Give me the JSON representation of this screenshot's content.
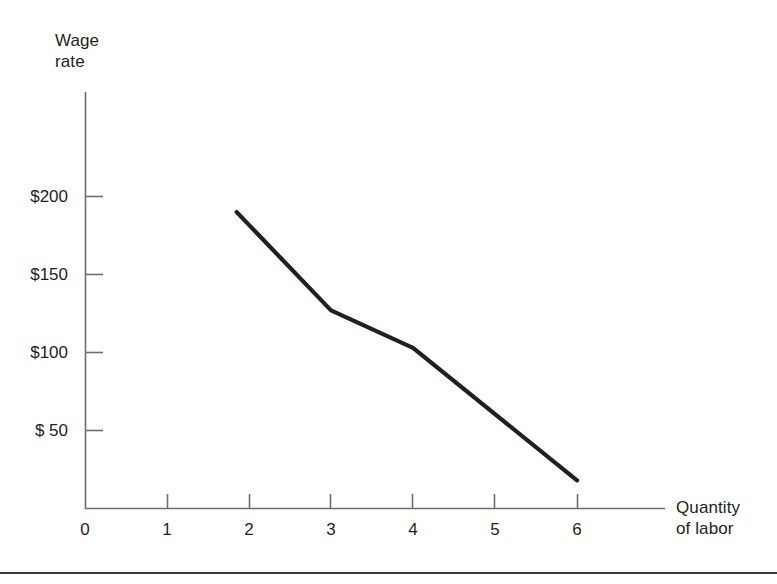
{
  "figure": {
    "background_color": "#ffffff",
    "line_color": "#231f20",
    "axis_color": "#6e6e6e",
    "text_color": "#231f20"
  },
  "chart_data": {
    "type": "line",
    "title": "",
    "xlabel": "Quantity of labor",
    "ylabel": "Wage rate",
    "xlabel_lines": [
      "Quantity",
      "of labor"
    ],
    "ylabel_lines": [
      "Wage",
      "rate"
    ],
    "x": [
      1.85,
      3,
      4,
      6
    ],
    "values": [
      190,
      127,
      103,
      18
    ],
    "series": [
      {
        "name": "Wage rate",
        "x": [
          1.85,
          3,
          4,
          6
        ],
        "values": [
          190,
          127,
          103,
          18
        ]
      }
    ],
    "x_ticks": [
      0,
      1,
      2,
      3,
      4,
      5,
      6
    ],
    "x_tick_labels": [
      "0",
      "1",
      "2",
      "3",
      "4",
      "5",
      "6"
    ],
    "y_ticks": [
      50,
      100,
      150,
      200
    ],
    "y_tick_labels": [
      "$ 50",
      "$100",
      "$150",
      "$200"
    ],
    "xlim": [
      0,
      7
    ],
    "ylim": [
      0,
      250
    ],
    "grid": false,
    "legend": false,
    "legend_position": "none"
  },
  "axes": {
    "y_title": "Wage\nrate",
    "x_title": "Quantity\nof labor"
  },
  "y_labels": [
    {
      "text": "$200",
      "value": 200
    },
    {
      "text": "$150",
      "value": 150
    },
    {
      "text": "$100",
      "value": 100
    },
    {
      "text": "$ 50",
      "value": 50
    }
  ],
  "x_labels": [
    {
      "text": "0",
      "value": 0
    },
    {
      "text": "1",
      "value": 1
    },
    {
      "text": "2",
      "value": 2
    },
    {
      "text": "3",
      "value": 3
    },
    {
      "text": "4",
      "value": 4
    },
    {
      "text": "5",
      "value": 5
    },
    {
      "text": "6",
      "value": 6
    }
  ]
}
